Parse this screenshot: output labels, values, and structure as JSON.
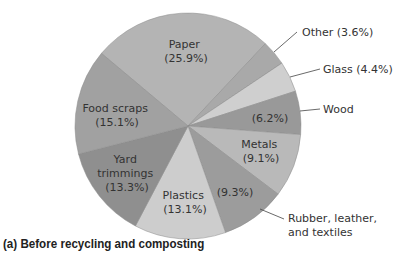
{
  "chart_data": {
    "type": "pie",
    "title": "(a) Before recycling and composting",
    "start_angle_deg": 310,
    "direction": "clockwise",
    "slices": [
      {
        "label": "Paper",
        "value": 25.9,
        "value_label": "(25.9%)",
        "color": "#b4b4b4"
      },
      {
        "label": "Other",
        "value": 3.6,
        "value_label": "(3.6%)",
        "color": "#a9a9a9"
      },
      {
        "label": "Glass",
        "value": 4.4,
        "value_label": "(4.4%)",
        "color": "#cfcfcf"
      },
      {
        "label": "Wood",
        "value": 6.2,
        "value_label": "(6.2%)",
        "color": "#999999"
      },
      {
        "label": "Metals",
        "value": 9.1,
        "value_label": "(9.1%)",
        "color": "#b9b9b9"
      },
      {
        "label": "Rubber, leather, and textiles",
        "value": 9.3,
        "value_label": "(9.3%)",
        "color": "#9c9c9c"
      },
      {
        "label": "Plastics",
        "value": 13.1,
        "value_label": "(13.1%)",
        "color": "#cdcdcd"
      },
      {
        "label": "Yard trimmings",
        "value": 13.3,
        "value_label": "(13.3%)",
        "color": "#8f8f8f"
      },
      {
        "label": "Food scraps",
        "value": 15.1,
        "value_label": "(15.1%)",
        "color": "#a1a1a1"
      }
    ],
    "legend": "none (labels placed on/around slices)"
  },
  "labels": {
    "paper": [
      "Paper",
      "(25.9%)"
    ],
    "food": [
      "Food scraps",
      "(15.1%)"
    ],
    "yard": [
      "Yard",
      "trimmings",
      "(13.3%)"
    ],
    "plastics": [
      "Plastics",
      "(13.1%)"
    ],
    "rubber_value": "(9.3%)",
    "rubber_callout": [
      "Rubber, leather,",
      "and textiles"
    ],
    "metals": [
      "Metals",
      "(9.1%)"
    ],
    "wood_value": "(6.2%)",
    "wood_callout": "Wood",
    "glass_callout": "Glass (4.4%)",
    "other_callout": "Other (3.6%)"
  },
  "caption": "(a) Before recycling and composting"
}
